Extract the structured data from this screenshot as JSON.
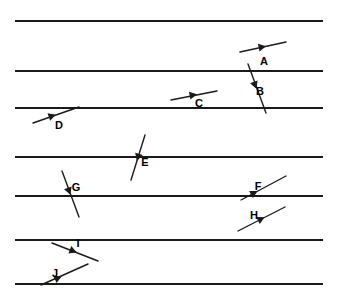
{
  "figure": {
    "width": 339,
    "height": 300,
    "background_color": "#ffffff",
    "line_color": "#1a1a1a",
    "label_color": "#000000"
  },
  "horizontal_lines": [
    {
      "id": "hline-1",
      "y": 21,
      "x1": 15,
      "x2": 323
    },
    {
      "id": "hline-2",
      "y": 71,
      "x1": 15,
      "x2": 323
    },
    {
      "id": "hline-3",
      "y": 108,
      "x1": 15,
      "x2": 323
    },
    {
      "id": "hline-4",
      "y": 157,
      "x1": 15,
      "x2": 323
    },
    {
      "id": "hline-5",
      "y": 196,
      "x1": 15,
      "x2": 323
    },
    {
      "id": "hline-6",
      "y": 240,
      "x1": 15,
      "x2": 323
    },
    {
      "id": "hline-7",
      "y": 284,
      "x1": 15,
      "x2": 323
    }
  ],
  "segments": [
    {
      "label": "A",
      "x1": 240,
      "y1": 52,
      "x2": 286,
      "y2": 42,
      "marker": {
        "x": 262,
        "y": 47,
        "angle": -12,
        "type": "arrowhead-right"
      },
      "label_x": 264,
      "label_y": 62
    },
    {
      "label": "B",
      "x1": 248,
      "y1": 64,
      "x2": 266,
      "y2": 113,
      "marker": {
        "x": 255,
        "y": 85,
        "angle": 70,
        "type": "arrowhead-down"
      },
      "label_x": 260,
      "label_y": 92
    },
    {
      "label": "C",
      "x1": 171,
      "y1": 100,
      "x2": 217,
      "y2": 91,
      "marker": {
        "x": 193,
        "y": 95,
        "angle": -11,
        "type": "arrowhead-right"
      },
      "label_x": 199,
      "label_y": 104
    },
    {
      "label": "D",
      "x1": 33,
      "y1": 123,
      "x2": 79,
      "y2": 107,
      "marker": {
        "x": 52,
        "y": 116,
        "angle": -19,
        "type": "arrowhead-right"
      },
      "label_x": 59,
      "label_y": 126
    },
    {
      "label": "E",
      "x1": 145,
      "y1": 135,
      "x2": 131,
      "y2": 180,
      "marker": {
        "x": 138,
        "y": 157,
        "angle": 107,
        "type": "arrowhead-down"
      },
      "label_x": 145,
      "label_y": 163
    },
    {
      "label": "F",
      "x1": 241,
      "y1": 200,
      "x2": 286,
      "y2": 176,
      "marker": {
        "x": 254,
        "y": 193,
        "angle": -28,
        "type": "arrowhead-right"
      },
      "label_x": 258,
      "label_y": 187
    },
    {
      "label": "G",
      "x1": 62,
      "y1": 171,
      "x2": 79,
      "y2": 217,
      "marker": {
        "x": 69,
        "y": 191,
        "angle": 70,
        "type": "arrowhead-down"
      },
      "label_x": 76,
      "label_y": 188
    },
    {
      "label": "H",
      "x1": 238,
      "y1": 231,
      "x2": 285,
      "y2": 207,
      "marker": {
        "x": 261,
        "y": 219,
        "angle": -27,
        "type": "arrowhead-right"
      },
      "label_x": 254,
      "label_y": 216
    },
    {
      "label": "I",
      "x1": 52,
      "y1": 243,
      "x2": 98,
      "y2": 261,
      "marker": {
        "x": 73,
        "y": 251,
        "angle": 21,
        "type": "arrowhead-right"
      },
      "label_x": 78,
      "label_y": 244
    },
    {
      "label": "J",
      "x1": 41,
      "y1": 285,
      "x2": 88,
      "y2": 264,
      "marker": {
        "x": 58,
        "y": 278,
        "angle": -24,
        "type": "arrowhead-right"
      },
      "label_x": 55,
      "label_y": 274
    }
  ]
}
